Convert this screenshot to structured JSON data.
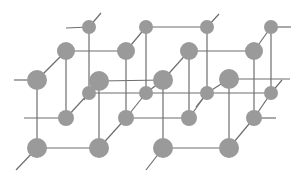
{
  "diagram": {
    "type": "crystal-lattice",
    "colors": {
      "atom": "#9a9a9a",
      "bond": "#6e6e6e",
      "background": "#ffffff"
    },
    "atoms": [
      {
        "id": "a1",
        "x": 89,
        "y": 27,
        "r": 7
      },
      {
        "id": "a2",
        "x": 146,
        "y": 27,
        "r": 7
      },
      {
        "id": "a3",
        "x": 207,
        "y": 27,
        "r": 7
      },
      {
        "id": "a4",
        "x": 271,
        "y": 27,
        "r": 7
      },
      {
        "id": "b1",
        "x": 66,
        "y": 51,
        "r": 9
      },
      {
        "id": "b2",
        "x": 126,
        "y": 51,
        "r": 9
      },
      {
        "id": "b3",
        "x": 189,
        "y": 51,
        "r": 9
      },
      {
        "id": "b4",
        "x": 254,
        "y": 51,
        "r": 9
      },
      {
        "id": "c1",
        "x": 37,
        "y": 80,
        "r": 10
      },
      {
        "id": "c2",
        "x": 99,
        "y": 81,
        "r": 10
      },
      {
        "id": "c3",
        "x": 163,
        "y": 80,
        "r": 10
      },
      {
        "id": "c4",
        "x": 229,
        "y": 79,
        "r": 10
      },
      {
        "id": "d1",
        "x": 89,
        "y": 93,
        "r": 7
      },
      {
        "id": "d2",
        "x": 146,
        "y": 93,
        "r": 7
      },
      {
        "id": "d3",
        "x": 207,
        "y": 93,
        "r": 7
      },
      {
        "id": "d4",
        "x": 271,
        "y": 93,
        "r": 7
      },
      {
        "id": "e1",
        "x": 66,
        "y": 118,
        "r": 8
      },
      {
        "id": "e2",
        "x": 126,
        "y": 118,
        "r": 8
      },
      {
        "id": "e3",
        "x": 189,
        "y": 118,
        "r": 8
      },
      {
        "id": "e4",
        "x": 254,
        "y": 118,
        "r": 8
      },
      {
        "id": "f1",
        "x": 37,
        "y": 148,
        "r": 10
      },
      {
        "id": "f2",
        "x": 99,
        "y": 148,
        "r": 10
      },
      {
        "id": "f3",
        "x": 163,
        "y": 148,
        "r": 10
      },
      {
        "id": "f4",
        "x": 229,
        "y": 148,
        "r": 10
      }
    ],
    "bonds": [
      [
        66,
        28,
        89,
        27
      ],
      [
        89,
        27,
        101,
        13
      ],
      [
        146,
        27,
        207,
        27
      ],
      [
        207,
        27,
        219,
        14
      ],
      [
        271,
        27,
        291,
        27
      ],
      [
        89,
        27,
        89,
        93
      ],
      [
        146,
        27,
        146,
        93
      ],
      [
        207,
        27,
        207,
        93
      ],
      [
        271,
        27,
        271,
        93
      ],
      [
        66,
        51,
        126,
        51
      ],
      [
        189,
        51,
        254,
        51
      ],
      [
        126,
        51,
        146,
        27
      ],
      [
        254,
        51,
        271,
        27
      ],
      [
        66,
        51,
        66,
        118
      ],
      [
        126,
        51,
        126,
        118
      ],
      [
        189,
        51,
        189,
        118
      ],
      [
        254,
        51,
        254,
        118
      ],
      [
        14,
        80,
        37,
        80
      ],
      [
        37,
        80,
        66,
        51
      ],
      [
        163,
        80,
        189,
        51
      ],
      [
        37,
        80,
        37,
        148
      ],
      [
        99,
        81,
        99,
        148
      ],
      [
        163,
        80,
        163,
        148
      ],
      [
        229,
        79,
        229,
        148
      ],
      [
        99,
        81,
        163,
        80
      ],
      [
        229,
        79,
        290,
        79
      ],
      [
        89,
        93,
        146,
        93
      ],
      [
        146,
        93,
        207,
        93
      ],
      [
        207,
        93,
        271,
        93
      ],
      [
        99,
        81,
        89,
        93
      ],
      [
        163,
        80,
        146,
        93
      ],
      [
        229,
        79,
        207,
        93
      ],
      [
        271,
        93,
        282,
        80
      ],
      [
        89,
        93,
        84,
        100
      ],
      [
        207,
        93,
        196,
        107
      ],
      [
        24,
        118,
        66,
        118
      ],
      [
        126,
        118,
        189,
        118
      ],
      [
        254,
        118,
        276,
        118
      ],
      [
        66,
        118,
        89,
        93
      ],
      [
        126,
        118,
        146,
        93
      ],
      [
        189,
        118,
        207,
        93
      ],
      [
        254,
        118,
        271,
        93
      ],
      [
        37,
        148,
        99,
        148
      ],
      [
        163,
        148,
        229,
        148
      ],
      [
        99,
        148,
        126,
        118
      ],
      [
        229,
        148,
        254,
        118
      ],
      [
        16,
        170,
        37,
        148
      ],
      [
        146,
        170,
        163,
        148
      ]
    ]
  }
}
